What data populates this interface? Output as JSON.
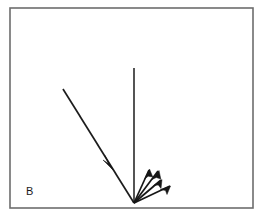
{
  "figure": {
    "panel_label": "B",
    "width": 262,
    "height": 218,
    "background_color": "#ffffff",
    "ink_color": "#161616",
    "frame_color": "#6d6d6d"
  },
  "chart_data": {
    "type": "scatter",
    "title": "B",
    "xlabel": "",
    "ylabel": "",
    "xlim": [
      0,
      262
    ],
    "ylim": [
      218,
      0
    ],
    "grid": false,
    "legend": null,
    "frame": {
      "x": 10,
      "y": 8,
      "width": 243,
      "height": 200,
      "stroke": "#6d6d6d",
      "stroke_width": 1.6
    },
    "origin": {
      "x": 134,
      "y": 203,
      "label": "incidence point"
    },
    "annotations": [
      {
        "name": "panel-label",
        "text": "B",
        "x": 26,
        "y": 195
      }
    ],
    "series": [
      {
        "name": "normal",
        "kind": "line",
        "arrow": false,
        "x": [
          134,
          134
        ],
        "y": [
          68,
          203
        ],
        "angle_deg": 90,
        "length_px": 135
      },
      {
        "name": "incident-ray",
        "kind": "arrow",
        "arrow": true,
        "arrow_position": "mid",
        "x": [
          63,
          134
        ],
        "y": [
          89,
          203
        ],
        "arrow_tip": {
          "x": 112,
          "y": 168
        },
        "angle_from_normal_deg": 32,
        "length_px": 134
      },
      {
        "name": "scattered-ray-1",
        "kind": "arrow",
        "arrow": true,
        "arrow_position": "end",
        "x": [
          134,
          149
        ],
        "y": [
          203,
          170
        ],
        "angle_from_normal_deg": 24,
        "length_px": 36
      },
      {
        "name": "scattered-ray-2",
        "kind": "arrow",
        "arrow": true,
        "arrow_position": "end",
        "x": [
          134,
          158
        ],
        "y": [
          203,
          171
        ],
        "angle_from_normal_deg": 37,
        "length_px": 40
      },
      {
        "name": "scattered-ray-3",
        "kind": "arrow",
        "arrow": true,
        "arrow_position": "end",
        "x": [
          134,
          161
        ],
        "y": [
          203,
          180
        ],
        "angle_from_normal_deg": 50,
        "length_px": 35
      },
      {
        "name": "scattered-ray-4",
        "kind": "arrow",
        "arrow": true,
        "arrow_position": "end",
        "x": [
          134,
          170
        ],
        "y": [
          203,
          186
        ],
        "angle_from_normal_deg": 65,
        "length_px": 40
      }
    ]
  }
}
